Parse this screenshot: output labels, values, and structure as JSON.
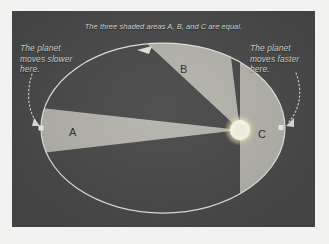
{
  "diagram": {
    "kind": "keplers-second-law-orbit-diagram",
    "title_caption": "The three shaded areas A, B, and C are equal.",
    "left_caption": "The planet\nmoves slower\nhere.",
    "right_caption": "The planet\nmoves faster\nhere."
  },
  "sectors": [
    {
      "id": "A",
      "label": "A"
    },
    {
      "id": "B",
      "label": "B"
    },
    {
      "id": "C",
      "label": "C"
    }
  ],
  "colors": {
    "panel_background": "#4b4b4b",
    "page_background": "#f2f2f0",
    "sector_fill": "#b6b6ae",
    "orbit_stroke": "#e6e6e0",
    "sun_core": "#fdfdf4",
    "sun_glow": "#f0efc8",
    "caption_text": "#d9d9d4",
    "sector_label_text": "#2f2f2f",
    "planet_marker": "#f5f5ee"
  },
  "geometry": {
    "orbit_center_x": 151,
    "orbit_center_y": 117,
    "orbit_radius_x": 122,
    "orbit_radius_y": 85,
    "sun_x": 228,
    "sun_y": 119,
    "sun_radius": 10,
    "planet_left_x": 29,
    "planet_left_y": 117,
    "planet_right_x": 269,
    "planet_right_y": 117
  },
  "icons": {
    "sun": "sun-icon",
    "planet": "planet-dot-icon",
    "direction_arrow": "orbit-direction-arrow-icon",
    "left_pointer": "dotted-pointer-arrow-icon",
    "right_pointer": "dotted-pointer-arrow-icon"
  }
}
